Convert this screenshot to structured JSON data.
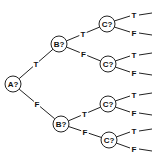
{
  "diagram": {
    "type": "decision-tree",
    "nodes": [
      {
        "id": "a",
        "label": "A?"
      },
      {
        "id": "b1",
        "label": "B?"
      },
      {
        "id": "b2",
        "label": "B?"
      },
      {
        "id": "c1",
        "label": "C?"
      },
      {
        "id": "c2",
        "label": "C?"
      },
      {
        "id": "c3",
        "label": "C?"
      },
      {
        "id": "c4",
        "label": "C?"
      }
    ],
    "edges": [
      {
        "from": "a",
        "to": "b1",
        "label": "T"
      },
      {
        "from": "a",
        "to": "b2",
        "label": "F"
      },
      {
        "from": "b1",
        "to": "c1",
        "label": "T"
      },
      {
        "from": "b1",
        "to": "c2",
        "label": "F"
      },
      {
        "from": "b2",
        "to": "c3",
        "label": "T"
      },
      {
        "from": "b2",
        "to": "c4",
        "label": "F"
      }
    ],
    "leaf_edges": [
      {
        "from": "c1",
        "label": "T"
      },
      {
        "from": "c1",
        "label": "F"
      },
      {
        "from": "c2",
        "label": "T"
      },
      {
        "from": "c2",
        "label": "F"
      },
      {
        "from": "c3",
        "label": "T"
      },
      {
        "from": "c3",
        "label": "F"
      },
      {
        "from": "c4",
        "label": "T"
      },
      {
        "from": "c4",
        "label": "F"
      }
    ]
  }
}
